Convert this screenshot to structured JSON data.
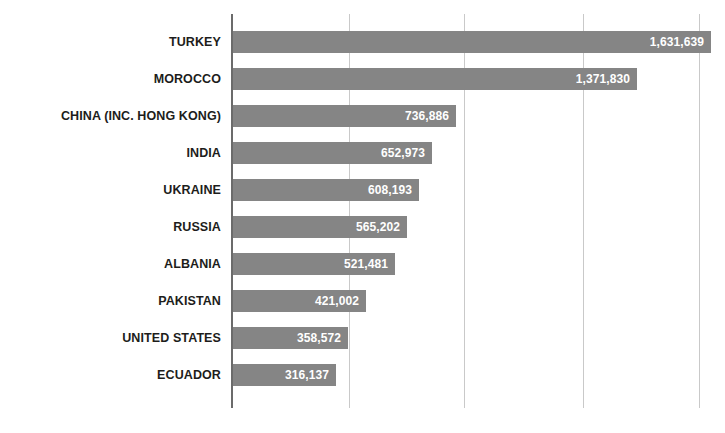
{
  "chart_data": {
    "type": "bar",
    "orientation": "horizontal",
    "title": "",
    "subtitle": "",
    "xlabel": "",
    "ylabel": "",
    "grid": true,
    "legend": "none",
    "xlim": [
      0,
      1720000
    ],
    "gridline_values": [
      360000,
      765000,
      1180000,
      1590000
    ],
    "categories": [
      "TURKEY",
      "MOROCCO",
      "CHINA (INC. HONG KONG)",
      "INDIA",
      "UKRAINE",
      "RUSSIA",
      "ALBANIA",
      "PAKISTAN",
      "UNITED STATES",
      "ECUADOR"
    ],
    "values": [
      1631639,
      1371830,
      736886,
      652973,
      608193,
      565202,
      521481,
      421002,
      358572,
      316137
    ],
    "value_labels": [
      "1,631,639",
      "1,371,830",
      "736,886",
      "652,973",
      "608,193",
      "565,202",
      "521,481",
      "421,002",
      "358,572",
      "316,137"
    ],
    "colors": {
      "bar": "#858585",
      "value_text": "#ffffff",
      "category_text": "#1d1d1b",
      "gridline": "#c9c9c9",
      "axis": "#6b6b6b",
      "background": "#ffffff"
    }
  }
}
